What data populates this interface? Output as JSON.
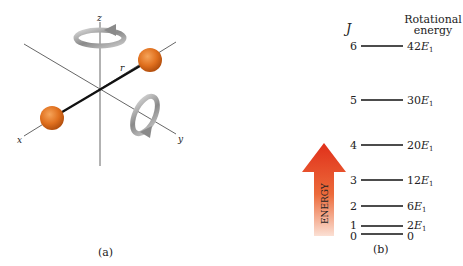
{
  "panel_a": {
    "caption": "(a)",
    "axes": {
      "x": "x",
      "y": "y",
      "z": "z"
    },
    "bond_label": "r",
    "atom_color": "#e0701e",
    "rotation_arrows": [
      "rotation-about-z",
      "rotation-about-y"
    ]
  },
  "panel_b": {
    "caption": "(b)",
    "j_header": "J",
    "energy_header_line1": "Rotational",
    "energy_header_line2": "energy",
    "arrow_label": "ENERGY",
    "arrow_color": "#e0301a",
    "levels": [
      {
        "j": "6",
        "energy": "42",
        "unit": "E",
        "sub": "1"
      },
      {
        "j": "5",
        "energy": "30",
        "unit": "E",
        "sub": "1"
      },
      {
        "j": "4",
        "energy": "20",
        "unit": "E",
        "sub": "1"
      },
      {
        "j": "3",
        "energy": "12",
        "unit": "E",
        "sub": "1"
      },
      {
        "j": "2",
        "energy": "6",
        "unit": "E",
        "sub": "1"
      },
      {
        "j": "1",
        "energy": "2",
        "unit": "E",
        "sub": "1"
      },
      {
        "j": "0",
        "energy": "0",
        "unit": "",
        "sub": ""
      }
    ]
  }
}
